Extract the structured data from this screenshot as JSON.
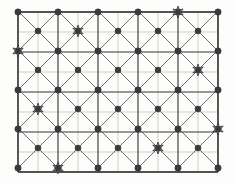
{
  "figure": {
    "background_color": "#fdfdfc",
    "width": 235,
    "height": 183
  },
  "chart_data": {
    "type": "scatter",
    "subtitle": "",
    "xlabel": "",
    "ylabel": "",
    "grid": true,
    "legend_position": "none",
    "xlim": [
      18,
      218
    ],
    "ylim": [
      12,
      168
    ],
    "geometry": {
      "origin_x": 18,
      "origin_y": 12,
      "major_spacing": 40,
      "sub_spacing": 20,
      "major_cols": 6,
      "major_rows": 5,
      "offset_cols": 5,
      "offset_rows": 4
    },
    "colors": {
      "subgrid": "#b9b9b4",
      "major_grid": "#4a4a4a",
      "diagonal": "#6f6f6f",
      "frame": "#3c3c3c",
      "node": "#3a3a3a",
      "star": "#7e7e7e"
    },
    "series": [
      {
        "name": "primary-nodes",
        "marker": "circle",
        "radius": 3.2,
        "points": [
          [
            18,
            12
          ],
          [
            58,
            12
          ],
          [
            98,
            12
          ],
          [
            138,
            12
          ],
          [
            178,
            12
          ],
          [
            218,
            12
          ],
          [
            18,
            51
          ],
          [
            58,
            51
          ],
          [
            98,
            51
          ],
          [
            138,
            51
          ],
          [
            178,
            51
          ],
          [
            218,
            51
          ],
          [
            18,
            90
          ],
          [
            58,
            90
          ],
          [
            98,
            90
          ],
          [
            138,
            90
          ],
          [
            178,
            90
          ],
          [
            218,
            90
          ],
          [
            18,
            129
          ],
          [
            58,
            129
          ],
          [
            98,
            129
          ],
          [
            138,
            129
          ],
          [
            178,
            129
          ],
          [
            218,
            129
          ],
          [
            18,
            168
          ],
          [
            58,
            168
          ],
          [
            98,
            168
          ],
          [
            138,
            168
          ],
          [
            178,
            168
          ],
          [
            218,
            168
          ]
        ]
      },
      {
        "name": "offset-nodes",
        "marker": "circle",
        "radius": 3.0,
        "points": [
          [
            38,
            31
          ],
          [
            78,
            31
          ],
          [
            118,
            31
          ],
          [
            158,
            31
          ],
          [
            198,
            31
          ],
          [
            38,
            70
          ],
          [
            78,
            70
          ],
          [
            118,
            70
          ],
          [
            158,
            70
          ],
          [
            198,
            70
          ],
          [
            38,
            109
          ],
          [
            78,
            109
          ],
          [
            118,
            109
          ],
          [
            158,
            109
          ],
          [
            198,
            109
          ],
          [
            38,
            148
          ],
          [
            78,
            148
          ],
          [
            118,
            148
          ],
          [
            158,
            148
          ],
          [
            198,
            148
          ]
        ]
      },
      {
        "name": "starred-nodes",
        "marker": "star",
        "radius": 6.0,
        "count": 7,
        "points": [
          [
            178,
            12
          ],
          [
            78,
            31
          ],
          [
            18,
            51
          ],
          [
            198,
            70
          ],
          [
            38,
            109
          ],
          [
            218,
            129
          ],
          [
            158,
            148
          ],
          [
            58,
            168
          ]
        ]
      }
    ]
  }
}
